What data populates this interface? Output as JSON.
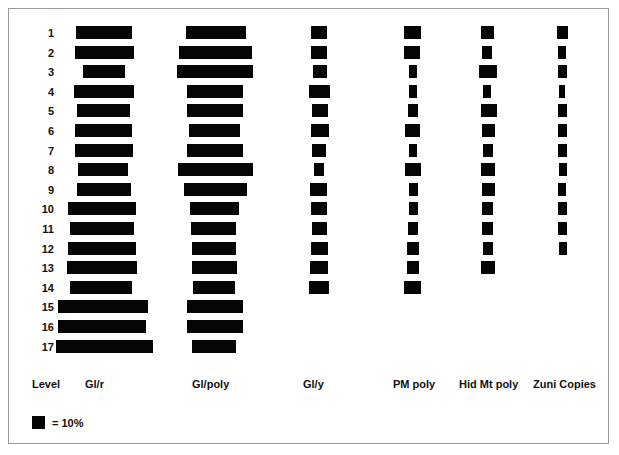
{
  "chart_data": {
    "type": "bar",
    "title": "",
    "subtitle": "",
    "xlabel": "",
    "ylabel": "Level",
    "orientation": "horizontal-centered",
    "grid": false,
    "legend_position": "bottom-left",
    "legend": [
      {
        "swatch": "black-square",
        "label": "= 10%"
      }
    ],
    "row_axis_label": "Level",
    "categories": [
      "1",
      "2",
      "3",
      "4",
      "5",
      "6",
      "7",
      "8",
      "9",
      "10",
      "11",
      "12",
      "13",
      "14",
      "15",
      "16",
      "17"
    ],
    "series": [
      {
        "name": "Gl/r",
        "values": [
          34,
          36,
          25,
          36,
          32,
          34,
          36,
          30,
          32,
          41,
          33,
          40,
          42,
          35,
          48,
          47,
          52
        ]
      },
      {
        "name": "Gl/poly",
        "values": [
          31,
          39,
          40,
          29,
          29,
          26,
          29,
          41,
          36,
          27,
          24,
          23,
          24,
          22,
          30,
          30,
          23
        ]
      },
      {
        "name": "Gl/y",
        "values": [
          9,
          9,
          8,
          12,
          9,
          10,
          8,
          6,
          10,
          9,
          9,
          10,
          10,
          12,
          0,
          0,
          0
        ]
      },
      {
        "name": "PM poly",
        "values": [
          10,
          9,
          5,
          5,
          6,
          9,
          5,
          10,
          5,
          5,
          6,
          7,
          7,
          10,
          0,
          0,
          0
        ]
      },
      {
        "name": "Hid Mt poly",
        "values": [
          8,
          6,
          11,
          5,
          10,
          8,
          6,
          9,
          8,
          7,
          7,
          6,
          9,
          0,
          0,
          0,
          0
        ]
      },
      {
        "name": "Zuni Copies",
        "values": [
          7,
          5,
          6,
          4,
          6,
          6,
          6,
          5,
          5,
          6,
          6,
          5,
          0,
          0,
          0,
          0,
          0
        ]
      }
    ],
    "bar_geometry": {
      "note": "pixel left/right extents measured per row per column",
      "columns": [
        {
          "name": "Gl/r",
          "center": 103,
          "header_x": 85,
          "rows": [
            {
              "level": "1",
              "left": 76,
              "width": 56
            },
            {
              "level": "2",
              "left": 75,
              "width": 59
            },
            {
              "level": "3",
              "left": 83,
              "width": 42
            },
            {
              "level": "4",
              "left": 74,
              "width": 60
            },
            {
              "level": "5",
              "left": 77,
              "width": 53
            },
            {
              "level": "6",
              "left": 75,
              "width": 57
            },
            {
              "level": "7",
              "left": 75,
              "width": 58
            },
            {
              "level": "8",
              "left": 78,
              "width": 50
            },
            {
              "level": "9",
              "left": 77,
              "width": 54
            },
            {
              "level": "10",
              "left": 68,
              "width": 68
            },
            {
              "level": "11",
              "left": 70,
              "width": 64
            },
            {
              "level": "12",
              "left": 68,
              "width": 68
            },
            {
              "level": "13",
              "left": 67,
              "width": 70
            },
            {
              "level": "14",
              "left": 70,
              "width": 62
            },
            {
              "level": "15",
              "left": 58,
              "width": 90
            },
            {
              "level": "16",
              "left": 58,
              "width": 88
            },
            {
              "level": "17",
              "left": 56,
              "width": 97
            }
          ]
        },
        {
          "name": "Gl/poly",
          "center": 215,
          "header_x": 192,
          "rows": [
            {
              "level": "1",
              "left": 186,
              "width": 60
            },
            {
              "level": "2",
              "left": 179,
              "width": 73
            },
            {
              "level": "3",
              "left": 177,
              "width": 76
            },
            {
              "level": "4",
              "left": 187,
              "width": 56
            },
            {
              "level": "5",
              "left": 187,
              "width": 56
            },
            {
              "level": "6",
              "left": 189,
              "width": 51
            },
            {
              "level": "7",
              "left": 187,
              "width": 56
            },
            {
              "level": "8",
              "left": 178,
              "width": 75
            },
            {
              "level": "9",
              "left": 184,
              "width": 63
            },
            {
              "level": "10",
              "left": 190,
              "width": 49
            },
            {
              "level": "11",
              "left": 191,
              "width": 45
            },
            {
              "level": "12",
              "left": 192,
              "width": 44
            },
            {
              "level": "13",
              "left": 192,
              "width": 45
            },
            {
              "level": "14",
              "left": 193,
              "width": 42
            },
            {
              "level": "15",
              "left": 187,
              "width": 56
            },
            {
              "level": "16",
              "left": 187,
              "width": 56
            },
            {
              "level": "17",
              "left": 192,
              "width": 44
            }
          ]
        },
        {
          "name": "Gl/y",
          "center": 319,
          "header_x": 303,
          "rows": [
            {
              "level": "1",
              "left": 311,
              "width": 16
            },
            {
              "level": "2",
              "left": 311,
              "width": 16
            },
            {
              "level": "3",
              "left": 313,
              "width": 14
            },
            {
              "level": "4",
              "left": 309,
              "width": 21
            },
            {
              "level": "5",
              "left": 312,
              "width": 16
            },
            {
              "level": "6",
              "left": 311,
              "width": 18
            },
            {
              "level": "7",
              "left": 312,
              "width": 14
            },
            {
              "level": "8",
              "left": 314,
              "width": 10
            },
            {
              "level": "9",
              "left": 310,
              "width": 17
            },
            {
              "level": "10",
              "left": 311,
              "width": 16
            },
            {
              "level": "11",
              "left": 312,
              "width": 15
            },
            {
              "level": "12",
              "left": 311,
              "width": 17
            },
            {
              "level": "13",
              "left": 310,
              "width": 18
            },
            {
              "level": "14",
              "left": 309,
              "width": 20
            }
          ]
        },
        {
          "name": "PM poly",
          "center": 411,
          "header_x": 393,
          "rows": [
            {
              "level": "1",
              "left": 404,
              "width": 17
            },
            {
              "level": "2",
              "left": 404,
              "width": 16
            },
            {
              "level": "3",
              "left": 409,
              "width": 8
            },
            {
              "level": "4",
              "left": 409,
              "width": 8
            },
            {
              "level": "5",
              "left": 408,
              "width": 10
            },
            {
              "level": "6",
              "left": 405,
              "width": 15
            },
            {
              "level": "7",
              "left": 409,
              "width": 8
            },
            {
              "level": "8",
              "left": 405,
              "width": 16
            },
            {
              "level": "9",
              "left": 409,
              "width": 9
            },
            {
              "level": "10",
              "left": 409,
              "width": 9
            },
            {
              "level": "11",
              "left": 408,
              "width": 10
            },
            {
              "level": "12",
              "left": 407,
              "width": 12
            },
            {
              "level": "13",
              "left": 407,
              "width": 12
            },
            {
              "level": "14",
              "left": 404,
              "width": 17
            }
          ]
        },
        {
          "name": "Hid Mt poly",
          "center": 486,
          "header_x": 459,
          "rows": [
            {
              "level": "1",
              "left": 481,
              "width": 13
            },
            {
              "level": "2",
              "left": 482,
              "width": 10
            },
            {
              "level": "3",
              "left": 479,
              "width": 18
            },
            {
              "level": "4",
              "left": 483,
              "width": 8
            },
            {
              "level": "5",
              "left": 481,
              "width": 16
            },
            {
              "level": "6",
              "left": 482,
              "width": 13
            },
            {
              "level": "7",
              "left": 483,
              "width": 10
            },
            {
              "level": "8",
              "left": 481,
              "width": 14
            },
            {
              "level": "9",
              "left": 482,
              "width": 13
            },
            {
              "level": "10",
              "left": 482,
              "width": 11
            },
            {
              "level": "11",
              "left": 482,
              "width": 11
            },
            {
              "level": "12",
              "left": 483,
              "width": 10
            },
            {
              "level": "13",
              "left": 481,
              "width": 14
            }
          ]
        },
        {
          "name": "Zuni Copies",
          "center": 562,
          "header_x": 533,
          "rows": [
            {
              "level": "1",
              "left": 557,
              "width": 11
            },
            {
              "level": "2",
              "left": 558,
              "width": 8
            },
            {
              "level": "3",
              "left": 558,
              "width": 9
            },
            {
              "level": "4",
              "left": 559,
              "width": 6
            },
            {
              "level": "5",
              "left": 558,
              "width": 9
            },
            {
              "level": "6",
              "left": 558,
              "width": 9
            },
            {
              "level": "7",
              "left": 558,
              "width": 9
            },
            {
              "level": "8",
              "left": 559,
              "width": 8
            },
            {
              "level": "9",
              "left": 558,
              "width": 8
            },
            {
              "level": "10",
              "left": 558,
              "width": 9
            },
            {
              "level": "11",
              "left": 558,
              "width": 9
            },
            {
              "level": "12",
              "left": 559,
              "width": 8
            }
          ]
        }
      ]
    }
  },
  "axis": {
    "row_header_label": "Level",
    "row_header_x": 32,
    "row_header_y": 378,
    "levels": [
      "1",
      "2",
      "3",
      "4",
      "5",
      "6",
      "7",
      "8",
      "9",
      "10",
      "11",
      "12",
      "13",
      "14",
      "15",
      "16",
      "17"
    ]
  },
  "legend": {
    "swatch_name": "black-square-swatch",
    "text": "= 10%"
  },
  "colors": {
    "bar": "#050505",
    "background": "#ffffff",
    "frame": "#9a9a9a",
    "text": "#111111"
  }
}
